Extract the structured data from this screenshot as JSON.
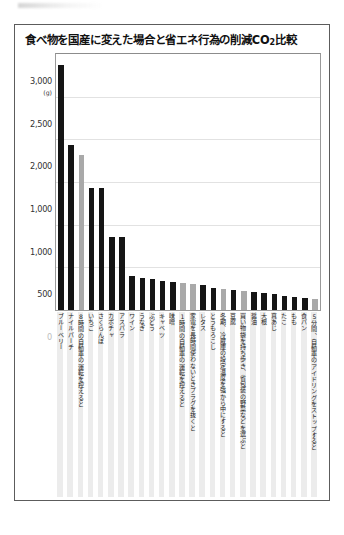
{
  "chart_data": {
    "type": "bar",
    "title": "食べ物を国産に変えた場合と省エネ行為の削減CO2比較",
    "title_main": "食べ物を国産に変えた場合と省エネ行為の削減CO",
    "title_sub": "2",
    "title_tail": "比較",
    "xlabel": "",
    "ylabel": "",
    "unit_label": "(g)",
    "ylim": [
      0,
      3000
    ],
    "grid": true,
    "legend_position": "none",
    "ytick_labels": [
      "3,000",
      "2,500",
      "2,000",
      "1,000",
      "1,000",
      "500",
      "0"
    ],
    "ytick_values": [
      3000,
      2500,
      2000,
      1500,
      1000,
      500,
      0
    ],
    "colors": {
      "food_bar": "#151515",
      "energy_bar": "#a9a9a9",
      "frame": "#5c5c5c",
      "grid": "#e2e2e2"
    },
    "series_names": [
      "食べ物を国産に変えた場合",
      "省エネ行為"
    ],
    "categories": [
      "ブルーベリー",
      "ナイルパーチ",
      "8時間の自動車の運転を控えると",
      "いちご",
      "さくらんぼ",
      "カボチャ",
      "アスパラ",
      "ワイン",
      "うなぎ",
      "ぶどう",
      "キャベツ",
      "味噌",
      "1時間の自動車の運転を控えると",
      "家電を長時間使わないときプラグを抜くと",
      "レタス",
      "とうもろこし",
      "冬期、冷蔵庫の設定温度を強から中にすると",
      "豆腐",
      "買い物袋を持ち歩き、省包装の野菜などを選ぶと",
      "醤油",
      "大根",
      "真あじ",
      "たこ",
      "もも",
      "食パン",
      "5分間、自動車のアイドリングをストップすると"
    ],
    "values": [
      2870,
      1930,
      1820,
      1430,
      1430,
      860,
      860,
      400,
      380,
      360,
      340,
      330,
      320,
      300,
      290,
      260,
      250,
      235,
      225,
      215,
      200,
      185,
      170,
      150,
      140,
      130
    ],
    "kinds": [
      "food",
      "food",
      "energy",
      "food",
      "food",
      "food",
      "food",
      "food",
      "food",
      "food",
      "food",
      "food",
      "energy",
      "energy",
      "food",
      "food",
      "energy",
      "food",
      "energy",
      "food",
      "food",
      "food",
      "food",
      "food",
      "food",
      "energy"
    ]
  }
}
